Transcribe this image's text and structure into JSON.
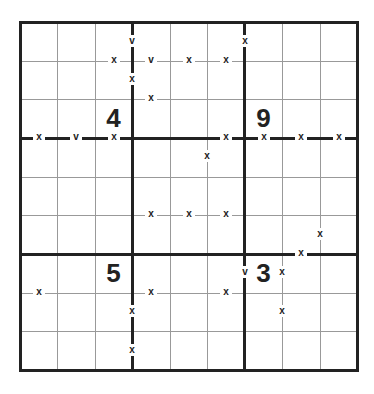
{
  "puzzle": {
    "type": "XV sudoku",
    "size": 9,
    "givens": [
      {
        "row": 2,
        "col": 2,
        "value": "4"
      },
      {
        "row": 2,
        "col": 6,
        "value": "9"
      },
      {
        "row": 6,
        "col": 2,
        "value": "5"
      },
      {
        "row": 6,
        "col": 6,
        "value": "3"
      }
    ],
    "markers": [
      {
        "x": 132,
        "y": 42,
        "label": "v"
      },
      {
        "x": 245,
        "y": 42,
        "label": "x"
      },
      {
        "x": 114,
        "y": 61,
        "label": "x"
      },
      {
        "x": 151,
        "y": 61,
        "label": "v"
      },
      {
        "x": 189,
        "y": 61,
        "label": "x"
      },
      {
        "x": 226,
        "y": 61,
        "label": "x"
      },
      {
        "x": 132,
        "y": 80,
        "label": "x"
      },
      {
        "x": 151,
        "y": 99,
        "label": "x"
      },
      {
        "x": 39,
        "y": 138,
        "label": "x"
      },
      {
        "x": 76,
        "y": 138,
        "label": "v"
      },
      {
        "x": 114,
        "y": 138,
        "label": "x"
      },
      {
        "x": 226,
        "y": 138,
        "label": "x"
      },
      {
        "x": 264,
        "y": 138,
        "label": "x"
      },
      {
        "x": 301,
        "y": 138,
        "label": "x"
      },
      {
        "x": 339,
        "y": 138,
        "label": "x"
      },
      {
        "x": 207,
        "y": 157,
        "label": "x"
      },
      {
        "x": 151,
        "y": 215,
        "label": "x"
      },
      {
        "x": 189,
        "y": 215,
        "label": "x"
      },
      {
        "x": 226,
        "y": 215,
        "label": "x"
      },
      {
        "x": 320,
        "y": 235,
        "label": "x"
      },
      {
        "x": 301,
        "y": 254,
        "label": "x"
      },
      {
        "x": 245,
        "y": 273,
        "label": "v"
      },
      {
        "x": 282,
        "y": 273,
        "label": "x"
      },
      {
        "x": 39,
        "y": 293,
        "label": "x"
      },
      {
        "x": 151,
        "y": 293,
        "label": "x"
      },
      {
        "x": 226,
        "y": 293,
        "label": "x"
      },
      {
        "x": 282,
        "y": 312,
        "label": "x"
      },
      {
        "x": 132,
        "y": 312,
        "label": "x"
      },
      {
        "x": 132,
        "y": 351,
        "label": "x"
      }
    ]
  },
  "colors": {
    "thick_line": "#222222",
    "thin_line": "#999999",
    "background": "#ffffff"
  }
}
